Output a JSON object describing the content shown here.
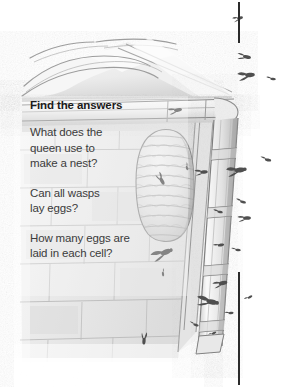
{
  "page": {
    "kind": "childrens-book-page",
    "background_color": "#ffffff"
  },
  "rules": {
    "color": "#2b2b2b",
    "top_label": "top-margin-rule",
    "bottom_label": "bottom-margin-rule"
  },
  "question_panel": {
    "title": "Find the answers",
    "title_color": "#1b1b1b",
    "text_color": "#3b3b3b",
    "questions": [
      {
        "lines": [
          "What does the",
          "queen use to",
          "make a nest?"
        ]
      },
      {
        "lines": [
          "Can all wasps",
          "lay eggs?"
        ]
      },
      {
        "lines": [
          "How many eggs are",
          "laid in each cell?"
        ]
      }
    ]
  },
  "illustration": {
    "description": "Pencil drawing of a wasp nest hanging under the eaves of a brick house, with gutter, downpipe, roof tiles and flying wasps",
    "medium": "graphite pencil sketch",
    "palette": {
      "paper": "#ffffff",
      "light_gray": "#ededed",
      "mid_gray": "#d2d2d2",
      "shadow_gray": "#a8a8a8",
      "line_gray": "#6e6e6e",
      "dark_line": "#4a4a4a"
    },
    "elements": [
      {
        "name": "roof-tiles",
        "label": "Curved roof tiles along the ridge"
      },
      {
        "name": "gutter",
        "label": "Horizontal rain gutter under the eaves"
      },
      {
        "name": "downpipe",
        "label": "Vertical drain pipe with jointed sections"
      },
      {
        "name": "wasp-nest",
        "label": "Papery wasp nest attached under the eaves"
      },
      {
        "name": "brick-wall",
        "label": "Brick and mortar house wall"
      },
      {
        "name": "flying-wasps",
        "label": "Wasps flying around the nest"
      }
    ],
    "wasp_count": 24
  }
}
